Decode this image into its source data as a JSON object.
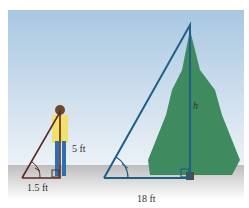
{
  "diagram": {
    "person_height_label": "5 ft",
    "person_shadow_label": "1.5 ft",
    "tree_shadow_label": "18 ft",
    "tree_height_label": "h",
    "colors": {
      "sky_top": "#a9c7e2",
      "sky_bottom": "#eef3f7",
      "ground": "#c9c9c9",
      "small_triangle": "#5a2a24",
      "large_triangle": "#1d5f86",
      "tree": "#3f8a5e",
      "person_shirt": "#f3e06a",
      "person_pants": "#2f6fb0"
    }
  }
}
